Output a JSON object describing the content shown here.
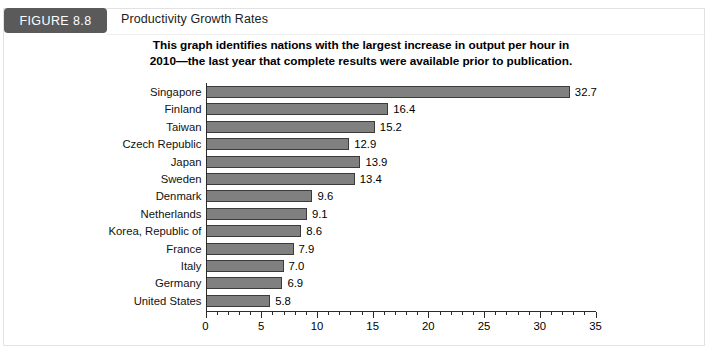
{
  "header": {
    "badge_label": "FIGURE 8.8",
    "caption": "Productivity Growth Rates"
  },
  "chart_data": {
    "type": "bar",
    "orientation": "horizontal",
    "title": "This graph identifies nations with the largest increase in output per hour in 2010—the last year that complete results were available prior to publication.",
    "title_line1": "This graph identifies nations with the largest increase in output per hour in",
    "title_line2": "2010—the last year that complete results were available prior to publication.",
    "xlabel": "",
    "ylabel": "",
    "xlim": [
      0,
      35
    ],
    "grid": false,
    "legend": "none",
    "bar_color": "#808080",
    "bar_border_color": "#3b3b3b",
    "x_ticks": [
      "0",
      "5",
      "10",
      "15",
      "20",
      "25",
      "30",
      "35"
    ],
    "x_tick_values": [
      0,
      5,
      10,
      15,
      20,
      25,
      30,
      35
    ],
    "x_minor_step": 1,
    "categories": [
      "Singapore",
      "Finland",
      "Taiwan",
      "Czech Republic",
      "Japan",
      "Sweden",
      "Denmark",
      "Netherlands",
      "Korea, Republic of",
      "France",
      "Italy",
      "Germany",
      "United States"
    ],
    "values": [
      32.7,
      16.4,
      15.2,
      12.9,
      13.9,
      13.4,
      9.6,
      9.1,
      8.6,
      7.9,
      7.0,
      6.9,
      5.8
    ],
    "value_labels": [
      "32.7",
      "16.4",
      "15.2",
      "12.9",
      "13.9",
      "13.4",
      "9.6",
      "9.1",
      "8.6",
      "7.9",
      "7.0",
      "6.9",
      "5.8"
    ]
  }
}
